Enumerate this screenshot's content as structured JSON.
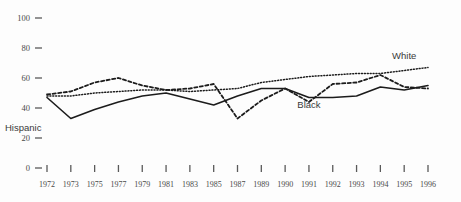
{
  "chart_data": {
    "type": "line",
    "title": "",
    "subtitle": "",
    "xlabel": "",
    "ylabel": "",
    "ylim": [
      0,
      100
    ],
    "yticks": [
      0,
      20,
      40,
      60,
      80,
      100
    ],
    "grid": false,
    "legend_position": "inline-annotations",
    "x": [
      1972,
      1973,
      1975,
      1977,
      1979,
      1981,
      1983,
      1985,
      1987,
      1989,
      1990,
      1991,
      1992,
      1993,
      1994,
      1995,
      1996
    ],
    "categories": [
      "1972",
      "1973",
      "1975",
      "1977",
      "1979",
      "1981",
      "1983",
      "1985",
      "1987",
      "1989",
      "1990",
      "1991",
      "1992",
      "1993",
      "1994",
      "1995",
      "1996"
    ],
    "series": [
      {
        "name": "White",
        "style": "dotted",
        "color": "#1c1c1c",
        "values": [
          48,
          48,
          50,
          51,
          52,
          52,
          51,
          52,
          53,
          57,
          59,
          61,
          62,
          63,
          63,
          65,
          67
        ]
      },
      {
        "name": "Black",
        "style": "solid",
        "color": "#1c1c1c",
        "values": [
          47,
          33,
          39,
          44,
          48,
          50,
          46,
          42,
          48,
          53,
          53,
          47,
          47,
          48,
          54,
          52,
          55
        ]
      },
      {
        "name": "Hispanic",
        "style": "dashed",
        "color": "#1c1c1c",
        "values": [
          49,
          51,
          57,
          60,
          55,
          52,
          53,
          56,
          33,
          45,
          53,
          44,
          56,
          57,
          62,
          54,
          53
        ]
      }
    ],
    "annotations": [
      {
        "label": "White",
        "x": 1995,
        "y": 73
      },
      {
        "label": "Black",
        "x": 1991,
        "y": 40
      },
      {
        "label": "Hispanic",
        "x": 1988,
        "y": 25
      }
    ]
  },
  "axis": {
    "y_tick_labels": [
      "100",
      "80",
      "60",
      "40",
      "20",
      "0"
    ],
    "x_tick_labels": [
      "1972",
      "1973",
      "1975",
      "1977",
      "1979",
      "1981",
      "1983",
      "1985",
      "1987",
      "1989",
      "1990",
      "1991",
      "1992",
      "1993",
      "1994",
      "1995",
      "1996"
    ]
  }
}
